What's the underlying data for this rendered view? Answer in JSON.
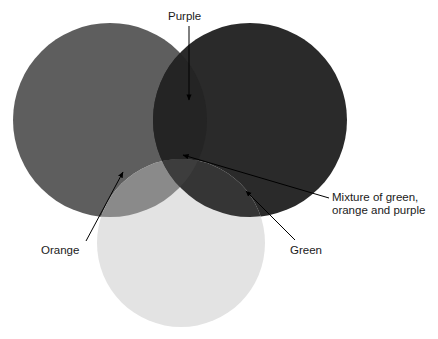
{
  "figure": {
    "type": "venn-diagram",
    "background_color": "#ffffff",
    "title": ""
  },
  "circles": [
    {
      "id": "orange",
      "label": "Orange",
      "color": "#5e5e5e",
      "cx": 110,
      "cy": 120,
      "r": 97
    },
    {
      "id": "purple",
      "label": "Purple",
      "color": "#2a2a2a",
      "cx": 250,
      "cy": 120,
      "r": 97
    },
    {
      "id": "green",
      "label": "Green",
      "color": "#e3e3e3",
      "cx": 181,
      "cy": 243,
      "r": 84
    }
  ],
  "overlaps": [
    {
      "id": "orange-purple",
      "color": "#242424"
    },
    {
      "id": "orange-green",
      "color": "#8a8a8a"
    },
    {
      "id": "green-purple",
      "color": "#353535"
    },
    {
      "id": "triple",
      "color": "#3d3d3d"
    }
  ],
  "labels": {
    "purple": {
      "text": "Purple",
      "x": 168,
      "y": 20
    },
    "orange": {
      "text": "Orange",
      "x": 41,
      "y": 254
    },
    "green": {
      "text": "Green",
      "x": 290,
      "y": 254
    },
    "mixture_line1": {
      "text": "Mixture of green,",
      "x": 332,
      "y": 201
    },
    "mixture_line2": {
      "text": "orange and purple",
      "x": 332,
      "y": 214
    }
  },
  "annotations": {
    "arrow_color": "#000000",
    "arrows": [
      {
        "id": "purple-arrow",
        "from_label": "Purple",
        "x1": 189,
        "y1": 26,
        "x2": 189,
        "y2": 100
      },
      {
        "id": "orange-arrow",
        "from_label": "Orange",
        "x1": 86,
        "y1": 241,
        "x2": 123,
        "y2": 172
      },
      {
        "id": "green-arrow",
        "from_label": "Green",
        "x1": 295,
        "y1": 240,
        "x2": 246,
        "y2": 191
      },
      {
        "id": "mixture-arrow",
        "from_label": "Mixture of green, orange and purple",
        "x1": 329,
        "y1": 198,
        "x2": 183,
        "y2": 155
      }
    ]
  }
}
